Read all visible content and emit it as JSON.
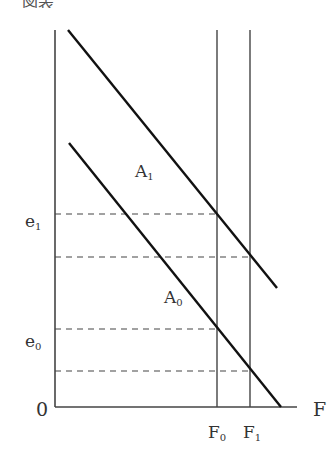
{
  "caption": {
    "text": "図表",
    "clipped": true
  },
  "diagram": {
    "axes": {
      "origin_label": "0",
      "x_label": "F",
      "y_axis": {
        "x": 55,
        "y_top": 30,
        "y_bottom": 407
      },
      "x_axis": {
        "y": 407,
        "x_left": 55,
        "x_right": 297
      }
    },
    "curves": [
      {
        "id": "A1",
        "label": "A",
        "subscript": "1",
        "from": [
          68,
          30
        ],
        "to": [
          277,
          288
        ]
      },
      {
        "id": "A0",
        "label": "A",
        "subscript": "0",
        "from": [
          69,
          143
        ],
        "to": [
          281,
          407
        ]
      }
    ],
    "verticals": [
      {
        "id": "F0",
        "label": "F",
        "subscript": "0",
        "x": 217
      },
      {
        "id": "F1",
        "label": "F",
        "subscript": "1",
        "x": 250
      }
    ],
    "dashed_lines": [
      {
        "y": 214,
        "to_x": 217,
        "label": "e",
        "subscript": "1"
      },
      {
        "y": 257,
        "to_x": 250,
        "label": "",
        "subscript": ""
      },
      {
        "y": 329,
        "to_x": 217,
        "label": "e",
        "subscript": "0"
      },
      {
        "y": 371,
        "to_x": 250,
        "label": "",
        "subscript": ""
      }
    ],
    "colors": {
      "axis": "#444444",
      "curve": "#111111",
      "dash": "#444444",
      "text": "#333333"
    }
  }
}
